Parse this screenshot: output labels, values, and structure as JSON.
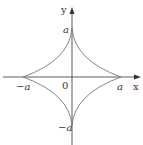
{
  "diagram": {
    "type": "astroid",
    "equation": "x^(2/3) + y^(2/3) = a^(2/3)",
    "axes": {
      "x_label": "x",
      "y_label": "y",
      "origin_label": "0"
    },
    "tick_labels": {
      "pos_x": "a",
      "neg_x": "−a",
      "pos_y": "a",
      "neg_y": "−a"
    },
    "colors": {
      "axis": "#333333",
      "curve": "#777777",
      "text": "#333333"
    }
  }
}
